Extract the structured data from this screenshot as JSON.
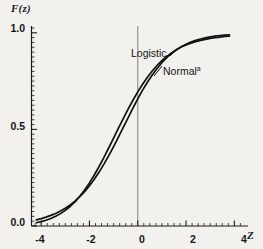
{
  "figure": {
    "background_color": "#f2f1ee",
    "curve_color": "#111111",
    "axis_color": "#1b1b1b",
    "reference_line_color": "#8c8c8c"
  },
  "axes": {
    "y_title": "F(z)",
    "x_title": "Z",
    "y_ticks": [
      "0.0",
      "0.5",
      "1.0"
    ],
    "x_ticks": [
      "-4",
      "-2",
      "0",
      "2",
      "4"
    ]
  },
  "labels": {
    "logistic": "Logistic",
    "normal": "Normal",
    "normal_superscript": "a"
  },
  "chart_data": {
    "type": "line",
    "title": "",
    "subtitle": "",
    "xlabel": "Z",
    "ylabel": "F(z)",
    "xlim": [
      -4.4,
      4.4
    ],
    "ylim": [
      0.0,
      1.03
    ],
    "x_ticks": [
      -4,
      -2,
      0,
      2,
      4
    ],
    "y_ticks": [
      0.0,
      0.5,
      1.0
    ],
    "x_minor_tick_step": 0.25,
    "y_minor_tick_step": 0.025,
    "grid": false,
    "legend": "inline-annotation",
    "annotations": [
      {
        "text": "Logistic",
        "x": -0.05,
        "y": 0.84
      },
      {
        "text": "Normal",
        "x": 0.95,
        "y": 0.735,
        "superscript": "a"
      }
    ],
    "reference_lines": [
      {
        "orientation": "vertical",
        "value": 0,
        "color": "#8c8c8c"
      }
    ],
    "x": [
      -4.2,
      -4.0,
      -3.8,
      -3.6,
      -3.4,
      -3.2,
      -3.0,
      -2.8,
      -2.6,
      -2.4,
      -2.2,
      -2.0,
      -1.8,
      -1.6,
      -1.4,
      -1.2,
      -1.0,
      -0.8,
      -0.6,
      -0.4,
      -0.2,
      0.0,
      0.2,
      0.4,
      0.6,
      0.8,
      1.0,
      1.2,
      1.4,
      1.6,
      1.8,
      2.0,
      2.2,
      2.4,
      2.6,
      2.8,
      3.0,
      3.2,
      3.4,
      3.6,
      3.8
    ],
    "series": [
      {
        "name": "Logistic",
        "values": [
          0.032,
          0.038,
          0.046,
          0.055,
          0.065,
          0.078,
          0.092,
          0.109,
          0.129,
          0.152,
          0.178,
          0.208,
          0.242,
          0.279,
          0.32,
          0.364,
          0.411,
          0.46,
          0.51,
          0.56,
          0.61,
          0.658,
          0.703,
          0.744,
          0.782,
          0.815,
          0.845,
          0.871,
          0.893,
          0.912,
          0.928,
          0.941,
          0.952,
          0.961,
          0.968,
          0.974,
          0.979,
          0.983,
          0.986,
          0.988,
          0.99
        ]
      },
      {
        "name": "Normal",
        "values": [
          0.017,
          0.023,
          0.03,
          0.039,
          0.05,
          0.064,
          0.081,
          0.101,
          0.125,
          0.154,
          0.186,
          0.223,
          0.264,
          0.308,
          0.355,
          0.405,
          0.455,
          0.506,
          0.556,
          0.605,
          0.651,
          0.694,
          0.734,
          0.77,
          0.802,
          0.831,
          0.856,
          0.878,
          0.896,
          0.912,
          0.926,
          0.937,
          0.946,
          0.954,
          0.961,
          0.966,
          0.971,
          0.975,
          0.978,
          0.981,
          0.983
        ]
      }
    ]
  }
}
